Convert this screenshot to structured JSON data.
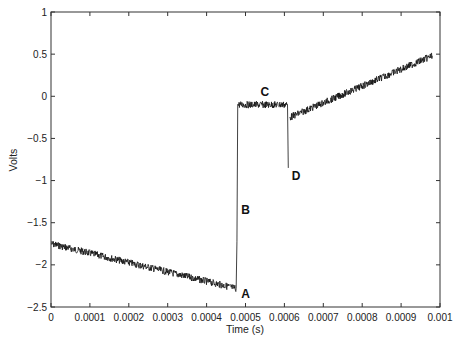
{
  "chart_data": {
    "type": "line",
    "title": "",
    "xlabel": "Time (s)",
    "ylabel": "Volts",
    "xlim": [
      0,
      0.001
    ],
    "ylim": [
      -2.5,
      1
    ],
    "grid": false,
    "legend": null,
    "x_ticks": [
      "0",
      "0.0001",
      "0.0002",
      "0.0003",
      "0.0004",
      "0.0005",
      "0.0006",
      "0.0007",
      "0.0008",
      "0.0009",
      "0.001"
    ],
    "y_ticks": [
      "1",
      "0.5",
      "0",
      "−0.5",
      "−1",
      "−1.5",
      "−2",
      "−2.5"
    ],
    "series": [
      {
        "name": "signal",
        "color": "#111111",
        "noisy": true,
        "segments": [
          {
            "x": [
              0.0,
              0.000476
            ],
            "y": [
              -1.75,
              -2.28
            ],
            "desc": "slow decline"
          },
          {
            "x": [
              0.000476,
              0.000478
            ],
            "y": [
              -2.28,
              -1.72
            ],
            "desc": "edge A to B"
          },
          {
            "x": [
              0.000478,
              0.00048
            ],
            "y": [
              -1.72,
              -0.1
            ],
            "desc": "rise B"
          },
          {
            "x": [
              0.00048,
              0.000608
            ],
            "y": [
              -0.1,
              -0.1
            ],
            "desc": "plateau C"
          },
          {
            "x": [
              0.000608,
              0.00061
            ],
            "y": [
              -0.1,
              -0.85
            ],
            "desc": "dip D"
          },
          {
            "x": [
              0.000614,
              0.00098
            ],
            "y": [
              -0.25,
              0.48
            ],
            "desc": "ramp up"
          }
        ]
      }
    ],
    "annotations": [
      {
        "label": "A",
        "x": 0.0005,
        "y": -2.35
      },
      {
        "label": "B",
        "x": 0.0005,
        "y": -1.35
      },
      {
        "label": "C",
        "x": 0.00055,
        "y": 0.05
      },
      {
        "label": "D",
        "x": 0.00063,
        "y": -0.95
      }
    ]
  }
}
